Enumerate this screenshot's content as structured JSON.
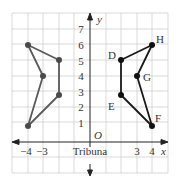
{
  "figure": {
    "axis_labels": {
      "x": "x",
      "y": "y",
      "origin": "O"
    },
    "x_ticks": [
      {
        "value": -4,
        "label": "−4"
      },
      {
        "value": -3,
        "label": "−3"
      },
      {
        "value": 3,
        "label": "3"
      },
      {
        "value": 4,
        "label": "4"
      }
    ],
    "y_ticks": [
      {
        "value": 1,
        "label": "1"
      },
      {
        "value": 2,
        "label": "2"
      },
      {
        "value": 3,
        "label": "3"
      },
      {
        "value": 4,
        "label": "4"
      },
      {
        "value": 5,
        "label": "5"
      },
      {
        "value": 6,
        "label": "6"
      },
      {
        "value": 7,
        "label": "7"
      }
    ],
    "axis_caption": "Tribuna",
    "left_shape": {
      "points": [
        [
          -4,
          6
        ],
        [
          -2,
          5
        ],
        [
          -2,
          3
        ],
        [
          -4,
          1
        ],
        [
          -3,
          4
        ]
      ],
      "color": "#555555"
    },
    "right_shape": {
      "points": [
        {
          "label": "H",
          "x": 4,
          "y": 6
        },
        {
          "label": "D",
          "x": 2,
          "y": 5
        },
        {
          "label": "E",
          "x": 2,
          "y": 3
        },
        {
          "label": "F",
          "x": 4,
          "y": 1
        },
        {
          "label": "G",
          "x": 3,
          "y": 4
        }
      ],
      "color": "#1a1a1a"
    },
    "point_labels": {
      "H": "H",
      "D": "D",
      "G": "G",
      "E": "E",
      "F": "F"
    },
    "grid": {
      "x_range": [
        -5,
        5
      ],
      "y_range": [
        -2,
        8
      ],
      "color": "#cccccc"
    }
  }
}
